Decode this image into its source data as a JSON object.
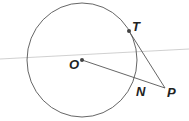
{
  "diagram": {
    "colors": {
      "stroke": "#555555",
      "guide_line": "#b8b8b8",
      "point": "#444444",
      "label": "#222222"
    },
    "circle": {
      "center_label": "O",
      "cx": 82,
      "cy": 60,
      "r": 56
    },
    "points": [
      {
        "label": "O",
        "x": 82,
        "y": 60,
        "label_x": 69,
        "label_y": 69
      },
      {
        "label": "T",
        "x": 129,
        "y": 31,
        "label_x": 132,
        "label_y": 31
      },
      {
        "label": "N",
        "x": 135,
        "y": 77,
        "label_x": 136,
        "label_y": 96
      },
      {
        "label": "P",
        "x": 165,
        "y": 88,
        "label_x": 167,
        "label_y": 97
      }
    ],
    "segments": [
      {
        "from": "O",
        "to": "P"
      },
      {
        "from": "T",
        "to": "P"
      }
    ],
    "guide_line": {
      "x1": 0,
      "y1": 59,
      "x2": 189,
      "y2": 49
    }
  }
}
